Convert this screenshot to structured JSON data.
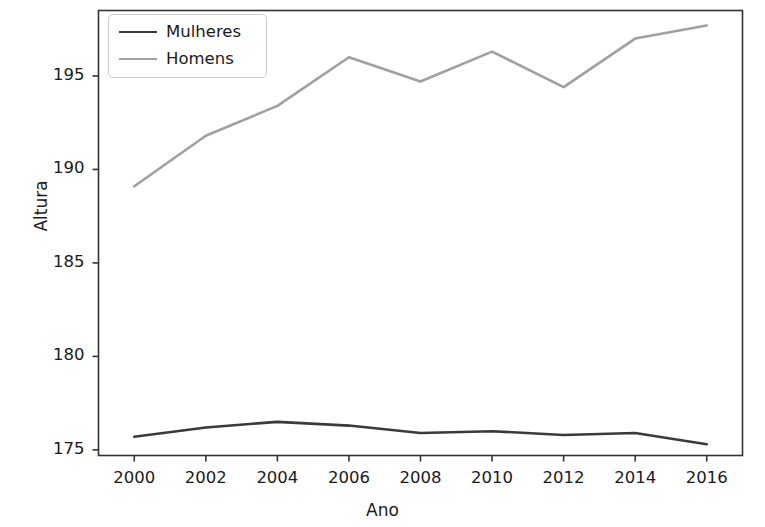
{
  "chart_data": {
    "type": "line",
    "title": "",
    "xlabel": "Ano",
    "ylabel": "Altura",
    "x": [
      2000,
      2002,
      2004,
      2006,
      2008,
      2010,
      2012,
      2014,
      2016
    ],
    "xtick_labels": [
      "2000",
      "2002",
      "2004",
      "2006",
      "2008",
      "2010",
      "2012",
      "2014",
      "2016"
    ],
    "ytick_labels": [
      "175",
      "180",
      "185",
      "190",
      "195"
    ],
    "yticks": [
      175,
      180,
      185,
      190,
      195
    ],
    "xlim": [
      1999,
      2017
    ],
    "ylim": [
      174.7,
      198.5
    ],
    "grid": false,
    "legend_position": "upper left",
    "series": [
      {
        "name": "Mulheres",
        "color": "#3a3a3a",
        "values": [
          175.7,
          176.2,
          176.5,
          176.3,
          175.9,
          176.0,
          175.8,
          175.9,
          175.3
        ]
      },
      {
        "name": "Homens",
        "color": "#a0a0a0",
        "values": [
          189.1,
          191.8,
          193.4,
          196.0,
          194.7,
          196.3,
          194.4,
          197.0,
          197.7
        ]
      }
    ]
  },
  "legend": {
    "items": [
      {
        "label": "Mulheres"
      },
      {
        "label": "Homens"
      }
    ]
  },
  "axes": {
    "frame_color": "#333333",
    "tick_color": "#333333"
  }
}
